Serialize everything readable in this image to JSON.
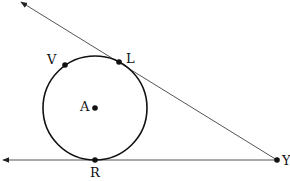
{
  "diagram": {
    "type": "geometry",
    "circle": {
      "center_label": "A",
      "cx": 95,
      "cy": 108,
      "r": 52
    },
    "points": [
      {
        "label": "V",
        "x": 65,
        "y": 65,
        "label_x": 52,
        "label_y": 64
      },
      {
        "label": "L",
        "x": 119,
        "y": 62,
        "label_x": 126,
        "label_y": 63
      },
      {
        "label": "A",
        "x": 95,
        "y": 108,
        "label_x": 81,
        "label_y": 110
      },
      {
        "label": "R",
        "x": 95,
        "y": 160,
        "label_x": 90,
        "label_y": 177
      },
      {
        "label": "Y",
        "x": 277,
        "y": 160,
        "label_x": 283,
        "label_y": 165
      }
    ],
    "lines": [
      {
        "name": "ray-YL",
        "from": "Y",
        "through": "L",
        "arrow_end": [
          21,
          2
        ]
      },
      {
        "name": "ray-YR",
        "from": "Y",
        "through": "R",
        "arrow_end": [
          3,
          160
        ]
      }
    ],
    "colors": {
      "stroke": "#111111",
      "line": "#555555",
      "background": "#ffffff"
    }
  }
}
